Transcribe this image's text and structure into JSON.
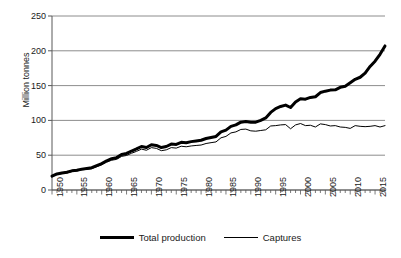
{
  "chart_data": {
    "type": "line",
    "title": "",
    "xlabel": "",
    "ylabel": "Million tonnes",
    "xlim": [
      1950,
      2017
    ],
    "ylim": [
      0,
      250
    ],
    "yticks": [
      0,
      50,
      100,
      150,
      200,
      250
    ],
    "xticks": [
      1950,
      1955,
      1960,
      1965,
      1970,
      1975,
      1980,
      1985,
      1990,
      1995,
      2000,
      2005,
      2010,
      2015
    ],
    "grid": "horizontal",
    "legend_position": "bottom",
    "x": [
      1950,
      1951,
      1952,
      1953,
      1954,
      1955,
      1956,
      1957,
      1958,
      1959,
      1960,
      1961,
      1962,
      1963,
      1964,
      1965,
      1966,
      1967,
      1968,
      1969,
      1970,
      1971,
      1972,
      1973,
      1974,
      1975,
      1976,
      1977,
      1978,
      1979,
      1980,
      1981,
      1982,
      1983,
      1984,
      1985,
      1986,
      1987,
      1988,
      1989,
      1990,
      1991,
      1992,
      1993,
      1994,
      1995,
      1996,
      1997,
      1998,
      1999,
      2000,
      2001,
      2002,
      2003,
      2004,
      2005,
      2006,
      2007,
      2008,
      2009,
      2010,
      2011,
      2012,
      2013,
      2014,
      2015,
      2016,
      2017
    ],
    "series": [
      {
        "name": "Total production",
        "line_width": 3,
        "color": "#000000",
        "values": [
          19.8,
          23.0,
          24.5,
          25.5,
          27.5,
          28.5,
          30.0,
          31.0,
          32.0,
          35.0,
          38.0,
          42.0,
          45.0,
          46.5,
          51.0,
          52.5,
          56.0,
          59.0,
          62.5,
          61.0,
          65.0,
          64.0,
          61.0,
          62.5,
          66.0,
          65.5,
          68.5,
          68.0,
          69.5,
          70.5,
          71.5,
          74.0,
          75.5,
          77.0,
          83.5,
          86.0,
          91.5,
          93.5,
          97.5,
          98.5,
          97.5,
          97.5,
          100.0,
          103.5,
          111.5,
          117.0,
          120.0,
          122.0,
          118.5,
          126.5,
          131.0,
          130.5,
          133.0,
          134.0,
          140.0,
          142.0,
          143.5,
          144.0,
          147.5,
          149.0,
          154.0,
          159.0,
          162.0,
          168.0,
          177.5,
          185.0,
          195.0,
          207.0
        ]
      },
      {
        "name": "Captures",
        "line_width": 1,
        "color": "#000000",
        "values": [
          19.2,
          22.3,
          23.7,
          24.6,
          26.5,
          27.4,
          28.8,
          29.7,
          30.6,
          33.4,
          36.2,
          40.0,
          42.8,
          44.0,
          48.3,
          49.6,
          52.8,
          55.5,
          58.7,
          57.1,
          60.9,
          59.8,
          56.5,
          57.7,
          60.9,
          60.2,
          62.9,
          62.1,
          63.3,
          64.0,
          64.6,
          66.8,
          68.0,
          69.1,
          75.0,
          77.0,
          82.0,
          83.5,
          87.0,
          87.5,
          85.0,
          84.5,
          85.5,
          86.5,
          92.0,
          92.5,
          93.5,
          94.0,
          88.0,
          93.5,
          95.5,
          92.5,
          93.0,
          90.5,
          95.0,
          94.0,
          92.0,
          92.5,
          90.5,
          90.0,
          88.5,
          92.5,
          91.5,
          91.0,
          91.5,
          92.5,
          90.5,
          92.5
        ]
      }
    ]
  },
  "legend": {
    "items": [
      {
        "label": "Total production",
        "style": "thick"
      },
      {
        "label": "Captures",
        "style": "thin"
      }
    ]
  },
  "axis": {
    "y_title": "Million tonnes"
  },
  "colors": {
    "line": "#000000",
    "grid": "#808080",
    "axis": "#595959",
    "background": "#ffffff"
  }
}
